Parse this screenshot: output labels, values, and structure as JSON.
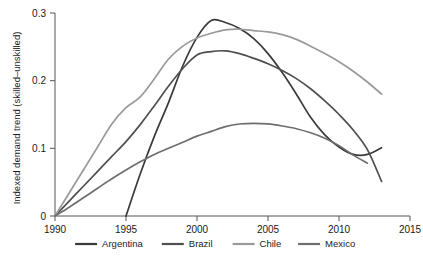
{
  "chart_data": {
    "type": "line",
    "title": "",
    "xlabel": "",
    "ylabel": "Indexed demand trend (skilled–unskilled)",
    "xlim": [
      1990,
      2015
    ],
    "ylim": [
      0,
      0.3
    ],
    "xticks": [
      1990,
      1995,
      2000,
      2005,
      2010,
      2015
    ],
    "xtick_labels": [
      "1990",
      "1995",
      "2000",
      "2005",
      "2010",
      "2015"
    ],
    "yticks": [
      0,
      0.1,
      0.2,
      0.3
    ],
    "ytick_labels": [
      "0",
      "0.1",
      "0.2",
      "0.3"
    ],
    "grid": false,
    "legend_position": "bottom",
    "series": [
      {
        "name": "Argentina",
        "color": "#3a3a3a",
        "x": [
          1995,
          1996,
          1997,
          1998,
          1999,
          2000,
          2001,
          2002,
          2003,
          2004,
          2005,
          2006,
          2007,
          2008,
          2009,
          2010,
          2011,
          2012,
          2013
        ],
        "values": [
          0.0,
          0.062,
          0.118,
          0.168,
          0.222,
          0.264,
          0.289,
          0.286,
          0.277,
          0.262,
          0.24,
          0.212,
          0.18,
          0.146,
          0.12,
          0.102,
          0.091,
          0.091,
          0.101
        ]
      },
      {
        "name": "Brazil",
        "color": "#4f4f4f",
        "x": [
          1990,
          1991,
          1992,
          1993,
          1994,
          1995,
          1996,
          1997,
          1998,
          1999,
          2000,
          2001,
          2002,
          2003,
          2004,
          2005,
          2006,
          2007,
          2008,
          2009,
          2010,
          2011,
          2012,
          2013
        ],
        "values": [
          0.0,
          0.022,
          0.044,
          0.066,
          0.088,
          0.11,
          0.135,
          0.163,
          0.192,
          0.218,
          0.238,
          0.243,
          0.244,
          0.24,
          0.233,
          0.225,
          0.215,
          0.203,
          0.188,
          0.17,
          0.15,
          0.127,
          0.098,
          0.051
        ]
      },
      {
        "name": "Chile",
        "color": "#9a9a9a",
        "x": [
          1990,
          1991,
          1992,
          1993,
          1994,
          1995,
          1996,
          1997,
          1998,
          1999,
          2000,
          2001,
          2002,
          2003,
          2004,
          2005,
          2006,
          2007,
          2008,
          2009,
          2010,
          2011,
          2012,
          2013
        ],
        "values": [
          0.0,
          0.034,
          0.068,
          0.102,
          0.136,
          0.16,
          0.176,
          0.203,
          0.232,
          0.251,
          0.263,
          0.27,
          0.275,
          0.276,
          0.274,
          0.272,
          0.268,
          0.261,
          0.251,
          0.24,
          0.228,
          0.214,
          0.198,
          0.18
        ]
      },
      {
        "name": "Mexico",
        "color": "#6e6e6e",
        "x": [
          1990,
          1991,
          1992,
          1993,
          1994,
          1995,
          1996,
          1997,
          1998,
          1999,
          2000,
          2001,
          2002,
          2003,
          2004,
          2005,
          2006,
          2007,
          2008,
          2009,
          2010,
          2011,
          2012
        ],
        "values": [
          0.0,
          0.013,
          0.027,
          0.041,
          0.055,
          0.068,
          0.08,
          0.091,
          0.1,
          0.109,
          0.118,
          0.125,
          0.132,
          0.136,
          0.137,
          0.136,
          0.133,
          0.129,
          0.123,
          0.115,
          0.104,
          0.09,
          0.078
        ]
      }
    ]
  },
  "legend": {
    "items": [
      {
        "label": "Argentina",
        "color": "#3a3a3a"
      },
      {
        "label": "Brazil",
        "color": "#4f4f4f"
      },
      {
        "label": "Chile",
        "color": "#9a9a9a"
      },
      {
        "label": "Mexico",
        "color": "#6e6e6e"
      }
    ]
  },
  "caption": {
    "text": ""
  }
}
